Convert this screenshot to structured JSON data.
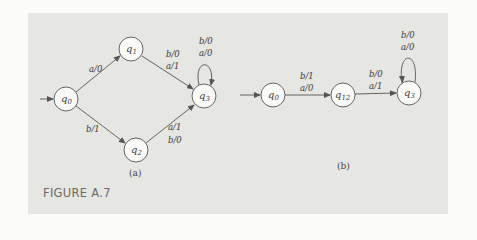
{
  "figure": {
    "title": "FIGURE A.7",
    "panel_color": "#e6e6e3",
    "line_color": "#555555"
  },
  "diagram_a": {
    "caption": "(a)",
    "start_state": "q0",
    "states": [
      {
        "id": "q0",
        "base": "q",
        "sub": "0"
      },
      {
        "id": "q1",
        "base": "q",
        "sub": "1"
      },
      {
        "id": "q2",
        "base": "q",
        "sub": "2"
      },
      {
        "id": "q3",
        "base": "q",
        "sub": "3"
      }
    ],
    "transitions": [
      {
        "from": "q0",
        "to": "q1",
        "labels": [
          "a/0"
        ]
      },
      {
        "from": "q0",
        "to": "q2",
        "labels": [
          "b/1"
        ]
      },
      {
        "from": "q1",
        "to": "q3",
        "labels": [
          "b/0",
          "a/1"
        ]
      },
      {
        "from": "q2",
        "to": "q3",
        "labels": [
          "a/1",
          "b/0"
        ]
      },
      {
        "from": "q3",
        "to": "q3",
        "labels": [
          "b/0",
          "a/0"
        ]
      }
    ]
  },
  "diagram_b": {
    "caption": "(b)",
    "start_state": "q0",
    "states": [
      {
        "id": "q0",
        "base": "q",
        "sub": "0"
      },
      {
        "id": "q12",
        "base": "q",
        "sub": "12"
      },
      {
        "id": "q3",
        "base": "q",
        "sub": "3"
      }
    ],
    "transitions": [
      {
        "from": "q0",
        "to": "q12",
        "labels": [
          "b/1",
          "a/0"
        ]
      },
      {
        "from": "q12",
        "to": "q3",
        "labels": [
          "b/0",
          "a/1"
        ]
      },
      {
        "from": "q3",
        "to": "q3",
        "labels": [
          "b/0",
          "a/0"
        ]
      }
    ]
  }
}
